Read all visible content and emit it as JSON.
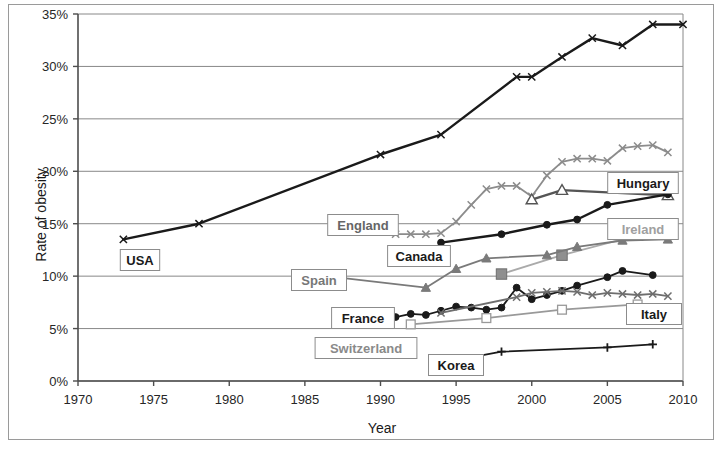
{
  "chart_data": {
    "type": "line",
    "title": "",
    "xlabel": "Year",
    "ylabel": "Rate of obesity",
    "xlim": [
      1970,
      2010
    ],
    "ylim": [
      0,
      35
    ],
    "xticks": [
      "1970",
      "1975",
      "1980",
      "1985",
      "1990",
      "1995",
      "2000",
      "2005",
      "2010"
    ],
    "yticks": [
      "0%",
      "5%",
      "10%",
      "15%",
      "20%",
      "25%",
      "30%",
      "35%"
    ],
    "grid": "horizontal",
    "legend_position": "inline-labels",
    "series": [
      {
        "name": "USA",
        "color": "#1a1a1a",
        "marker": "x",
        "label_color": "#1a1a1a",
        "label_x": 140,
        "label_y": 260,
        "x": [
          1973,
          1978,
          1990,
          1994,
          1999,
          2000,
          2002,
          2004,
          2006,
          2008,
          2010
        ],
        "y": [
          13.5,
          15.0,
          21.6,
          23.5,
          29.0,
          29.0,
          30.9,
          32.7,
          32.0,
          34.0,
          34.0
        ]
      },
      {
        "name": "Hungary",
        "color": "#8c8c8c",
        "marker": "x",
        "label_color": "#1a1a1a",
        "label_x": 643,
        "label_y": 183,
        "x": [
          1991,
          1992,
          1993,
          1994,
          1995,
          1996,
          1997,
          1998,
          1999,
          2000,
          2001,
          2002,
          2003,
          2004,
          2005,
          2006,
          2007,
          2008,
          2009
        ],
        "y": [
          14.0,
          14.0,
          14.0,
          14.1,
          15.2,
          16.8,
          18.3,
          18.6,
          18.6,
          17.6,
          19.6,
          20.9,
          21.2,
          21.2,
          21.0,
          22.2,
          22.4,
          22.5,
          21.8
        ]
      },
      {
        "name": "England",
        "color": "#555555",
        "marker": "triangle-open",
        "label_color": "#666666",
        "label_x": 363,
        "label_y": 225,
        "x": [
          2000,
          2002,
          2009
        ],
        "y": [
          17.3,
          18.2,
          17.7
        ]
      },
      {
        "name": "Canada",
        "color": "#1a1a1a",
        "marker": "circle",
        "label_color": "#1a1a1a",
        "label_x": 419,
        "label_y": 256,
        "x": [
          1994,
          1998,
          2001,
          2003,
          2005,
          2009
        ],
        "y": [
          13.2,
          14.0,
          14.9,
          15.4,
          16.8,
          17.8
        ]
      },
      {
        "name": "Ireland",
        "color": "#aaaaaa",
        "marker": "square-filled",
        "label_color": "#a0a0a0",
        "label_x": 643,
        "label_y": 229,
        "x": [
          1998,
          2002,
          2007
        ],
        "y": [
          10.2,
          12.0,
          13.9
        ]
      },
      {
        "name": "Spain",
        "color": "#7a7a7a",
        "marker": "triangle-filled",
        "label_color": "#777777",
        "label_x": 319,
        "label_y": 280,
        "x": [
          1987,
          1993,
          1995,
          1997,
          2001,
          2003,
          2006,
          2009
        ],
        "y": [
          9.9,
          8.9,
          10.7,
          11.7,
          12.0,
          12.8,
          13.4,
          13.5
        ]
      },
      {
        "name": "France",
        "color": "#1a1a1a",
        "marker": "circle",
        "label_color": "#1a1a1a",
        "label_x": 363,
        "label_y": 318,
        "x": [
          1990,
          1991,
          1992,
          1993,
          1994,
          1995,
          1996,
          1997,
          1998,
          1999,
          2000,
          2001,
          2002,
          2003,
          2005,
          2006,
          2008
        ],
        "y": [
          6.1,
          6.1,
          6.4,
          6.3,
          6.7,
          7.1,
          7.0,
          6.8,
          7.0,
          8.9,
          7.8,
          8.2,
          8.6,
          9.1,
          9.9,
          10.5,
          10.1
        ]
      },
      {
        "name": "Italy",
        "color": "#6e6e6e",
        "marker": "x",
        "label_color": "#1a1a1a",
        "label_x": 654,
        "label_y": 314,
        "x": [
          1994,
          1999,
          2000,
          2001,
          2002,
          2003,
          2004,
          2005,
          2006,
          2007,
          2008,
          2009
        ],
        "y": [
          6.5,
          8.0,
          8.4,
          8.5,
          8.6,
          8.5,
          8.2,
          8.4,
          8.3,
          8.2,
          8.3,
          8.1
        ]
      },
      {
        "name": "Switzerland",
        "color": "#999999",
        "marker": "square-open",
        "label_color": "#8a8a8a",
        "label_x": 366,
        "label_y": 348,
        "x": [
          1992,
          1997,
          2002,
          2007
        ],
        "y": [
          5.4,
          6.0,
          6.8,
          7.3
        ]
      },
      {
        "name": "Korea",
        "color": "#1a1a1a",
        "marker": "plus",
        "label_color": "#1a1a1a",
        "label_x": 456,
        "label_y": 365,
        "x": [
          1995,
          1998,
          2005,
          2008
        ],
        "y": [
          2.0,
          2.8,
          3.2,
          3.5
        ]
      }
    ]
  },
  "axes": {
    "x_title": "Year",
    "y_title": "Rate of obesity"
  }
}
